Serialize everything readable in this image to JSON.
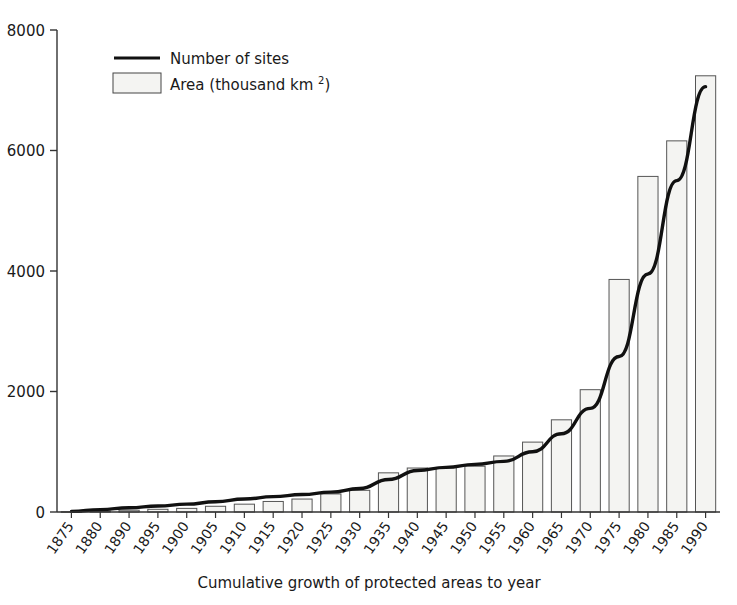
{
  "chart_data": {
    "type": "bar",
    "title": "",
    "subtitle": "",
    "xlabel": "Cumulative growth of protected areas to year",
    "ylabel": "",
    "ylim": [
      0,
      8000
    ],
    "ytick_labels": [
      "0",
      "2000",
      "4000",
      "6000",
      "8000"
    ],
    "ytick_values": [
      0,
      2000,
      4000,
      6000,
      8000
    ],
    "grid": false,
    "legend_position": "top-left",
    "categories": [
      "1875",
      "1880",
      "1890",
      "1895",
      "1900",
      "1905",
      "1910",
      "1915",
      "1920",
      "1925",
      "1930",
      "1935",
      "1940",
      "1945",
      "1950",
      "1955",
      "1960",
      "1965",
      "1970",
      "1975",
      "1980",
      "1985",
      "1990"
    ],
    "series": [
      {
        "name": "Area (thousand km 2)",
        "render": "bar",
        "values": [
          5,
          15,
          30,
          45,
          60,
          95,
          130,
          175,
          215,
          300,
          360,
          650,
          730,
          740,
          760,
          930,
          1160,
          1530,
          2030,
          3860,
          5570,
          6160,
          7240
        ]
      },
      {
        "name": "Number of sites",
        "render": "line",
        "values": [
          10,
          40,
          70,
          100,
          130,
          170,
          215,
          255,
          290,
          330,
          390,
          540,
          690,
          740,
          790,
          840,
          1000,
          1300,
          1720,
          2580,
          3950,
          5500,
          7060
        ]
      }
    ],
    "legend": [
      {
        "label_main": "Number of sites",
        "label_sup": "",
        "label_tail": "",
        "marker": "line"
      },
      {
        "label_main": "Area (thousand km ",
        "label_sup": "2",
        "label_tail": ")",
        "marker": "box"
      }
    ],
    "colors": {
      "line": "#111111",
      "bar_fill": "#f4f4f2",
      "bar_stroke": "#555555",
      "axis": "#333333",
      "text": "#1a1a1a",
      "background": "#ffffff"
    }
  }
}
